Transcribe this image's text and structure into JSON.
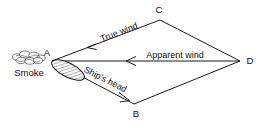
{
  "figure": {
    "background_color": "#ffffff",
    "line_color": "#1a1a1a"
  },
  "vertices": {
    "a": {
      "label": "A",
      "x": 52,
      "y": 61
    },
    "b": {
      "label": "B",
      "x": 134,
      "y": 104
    },
    "c": {
      "label": "C",
      "x": 160,
      "y": 20
    },
    "d": {
      "label": "D",
      "x": 240,
      "y": 61
    }
  },
  "edges": [
    {
      "name": "edge-a-c",
      "from": "a",
      "to": "c"
    },
    {
      "name": "edge-c-d",
      "from": "c",
      "to": "d"
    },
    {
      "name": "edge-a-d",
      "from": "a",
      "to": "d"
    },
    {
      "name": "edge-a-b",
      "from": "a",
      "to": "b"
    },
    {
      "name": "edge-b-d",
      "from": "b",
      "to": "d"
    }
  ],
  "labels": {
    "true_wind": "True wind",
    "apparent_wind": "Apparent wind",
    "ships_head": "Ship's head",
    "smoke": "Smoke",
    "vertex_a": "A",
    "vertex_b": "B",
    "vertex_c": "C",
    "vertex_d": "D"
  },
  "arrows": [
    {
      "name": "true-wind-arrow",
      "along": "C-to-A",
      "direction": "toward-A"
    },
    {
      "name": "apparent-wind-arrow",
      "along": "D-to-A",
      "direction": "toward-A"
    },
    {
      "name": "ships-head-arrow",
      "along": "A-to-B",
      "direction": "toward-B"
    }
  ]
}
